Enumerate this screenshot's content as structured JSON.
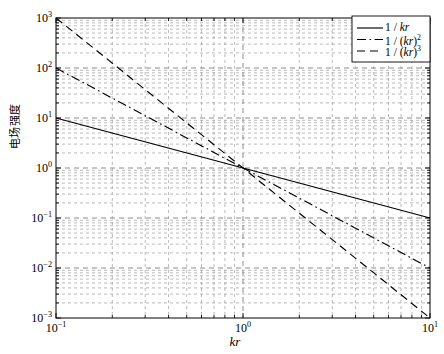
{
  "chart_data": {
    "type": "line",
    "title": "",
    "xlabel": "kr",
    "ylabel": "电场强度",
    "xscale": "log",
    "yscale": "log",
    "xlim": [
      0.1,
      10
    ],
    "ylim": [
      0.001,
      1000
    ],
    "grid": true,
    "grid_minor": true,
    "legend_position": "top-right",
    "xticks": [
      "10⁻¹",
      "10⁰",
      "10¹"
    ],
    "xtick_values": [
      0.1,
      1,
      10
    ],
    "yticks": [
      "10⁻³",
      "10⁻²",
      "10⁻¹",
      "10⁰",
      "10¹",
      "10²",
      "10³"
    ],
    "ytick_values": [
      0.001,
      0.01,
      0.1,
      1,
      10,
      100,
      1000
    ],
    "series": [
      {
        "name": "1 / kr",
        "label_base": "1 / ",
        "label_var": "kr",
        "label_exp": "",
        "style": "solid",
        "color": "#000000",
        "x": [
          0.1,
          1,
          10
        ],
        "values": [
          10,
          1,
          0.1
        ]
      },
      {
        "name": "1 / (kr)2",
        "label_base": "1 / (",
        "label_var": "kr",
        "label_exp": "2",
        "style": "dashdot",
        "color": "#000000",
        "x": [
          0.1,
          1,
          10
        ],
        "values": [
          100,
          1,
          0.01
        ]
      },
      {
        "name": "1 / (kr)3",
        "label_base": "1 / (",
        "label_var": "kr",
        "label_exp": "3",
        "style": "dashed",
        "color": "#000000",
        "x": [
          0.1,
          1,
          10
        ],
        "values": [
          1000,
          1,
          0.001
        ]
      }
    ]
  },
  "axis": {
    "x_tick_labels": [
      {
        "mantissa": "10",
        "exp": "−1"
      },
      {
        "mantissa": "10",
        "exp": "0"
      },
      {
        "mantissa": "10",
        "exp": "1"
      }
    ],
    "y_tick_labels": [
      {
        "mantissa": "10",
        "exp": "3"
      },
      {
        "mantissa": "10",
        "exp": "2"
      },
      {
        "mantissa": "10",
        "exp": "1"
      },
      {
        "mantissa": "10",
        "exp": "0"
      },
      {
        "mantissa": "10",
        "exp": "−1"
      },
      {
        "mantissa": "10",
        "exp": "−2"
      },
      {
        "mantissa": "10",
        "exp": "−3"
      }
    ],
    "x_title": "kr",
    "y_title": "电场强度"
  },
  "colors": {
    "line": "#000000",
    "grid": "#8d8d8d",
    "frame": "#000000",
    "background": "#ffffff",
    "legend_bg": "#ffffff"
  }
}
